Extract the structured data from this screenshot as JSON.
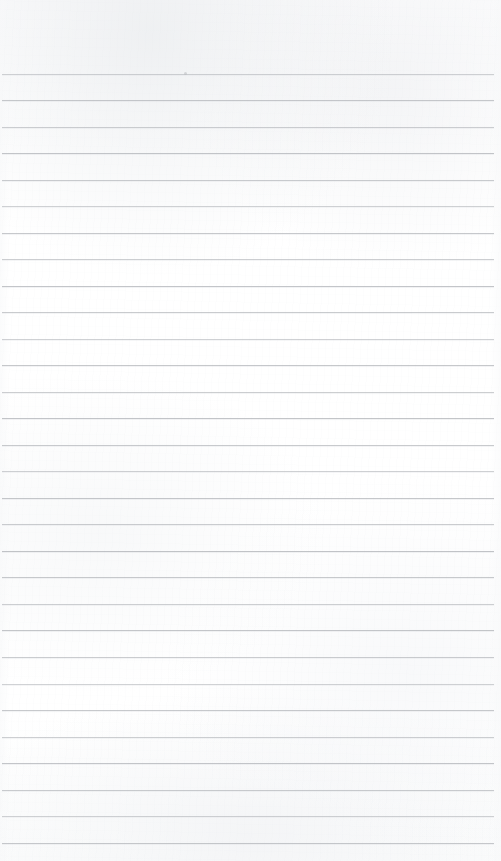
{
  "document": {
    "kind": "scanned-ruled-notepad-page",
    "title": "Blank Ruled Notebook Page",
    "text_content": "",
    "handwriting": "",
    "printed_text": "",
    "page_number": "",
    "header_text": "",
    "footer_text": ""
  },
  "canvas": {
    "width": 501,
    "height": 861,
    "background_color": "#ffffff",
    "paper_tint": "#fcfcfd"
  },
  "ruling": {
    "line_color": "#a9acb1",
    "line_opacity": 0.62,
    "line_thickness_px": 1,
    "first_line_y": 74,
    "line_spacing_px": 26.5,
    "line_count": 30,
    "line_start_x": 2,
    "line_end_x": 494,
    "top_margin_px": 74,
    "has_vertical_margin_rule": false,
    "lines": [
      {
        "y": 74,
        "x1": 2,
        "x2": 494
      },
      {
        "y": 100,
        "x1": 2,
        "x2": 494
      },
      {
        "y": 127,
        "x1": 2,
        "x2": 494
      },
      {
        "y": 153,
        "x1": 2,
        "x2": 494
      },
      {
        "y": 180,
        "x1": 2,
        "x2": 494
      },
      {
        "y": 206,
        "x1": 2,
        "x2": 494
      },
      {
        "y": 233,
        "x1": 2,
        "x2": 494
      },
      {
        "y": 259,
        "x1": 2,
        "x2": 494
      },
      {
        "y": 286,
        "x1": 2,
        "x2": 494
      },
      {
        "y": 312,
        "x1": 2,
        "x2": 494
      },
      {
        "y": 339,
        "x1": 2,
        "x2": 494
      },
      {
        "y": 365,
        "x1": 2,
        "x2": 494
      },
      {
        "y": 392,
        "x1": 2,
        "x2": 494
      },
      {
        "y": 418,
        "x1": 2,
        "x2": 494
      },
      {
        "y": 445,
        "x1": 2,
        "x2": 494
      },
      {
        "y": 471,
        "x1": 2,
        "x2": 494
      },
      {
        "y": 498,
        "x1": 2,
        "x2": 494
      },
      {
        "y": 524,
        "x1": 2,
        "x2": 494
      },
      {
        "y": 551,
        "x1": 2,
        "x2": 494
      },
      {
        "y": 577,
        "x1": 2,
        "x2": 494
      },
      {
        "y": 604,
        "x1": 2,
        "x2": 494
      },
      {
        "y": 630,
        "x1": 2,
        "x2": 494
      },
      {
        "y": 657,
        "x1": 2,
        "x2": 494
      },
      {
        "y": 684,
        "x1": 2,
        "x2": 494
      },
      {
        "y": 710,
        "x1": 2,
        "x2": 494
      },
      {
        "y": 737,
        "x1": 2,
        "x2": 494
      },
      {
        "y": 763,
        "x1": 2,
        "x2": 494
      },
      {
        "y": 790,
        "x1": 2,
        "x2": 494
      },
      {
        "y": 816,
        "x1": 2,
        "x2": 494
      },
      {
        "y": 843,
        "x1": 2,
        "x2": 494
      }
    ]
  },
  "artifacts": [
    {
      "name": "scan-speck",
      "x": 184,
      "y": 72,
      "size": 3,
      "color": "#b9bcc0"
    }
  ]
}
